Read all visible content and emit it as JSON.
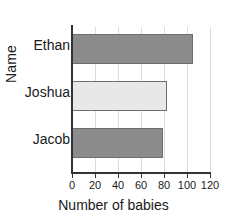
{
  "chart_data": {
    "type": "bar",
    "orientation": "horizontal",
    "title": "",
    "xlabel": "Number of babies",
    "ylabel": "Name",
    "categories": [
      "Ethan",
      "Joshua",
      "Jacob"
    ],
    "values": [
      105,
      83,
      79
    ],
    "series": [
      {
        "name": "Number of babies",
        "values": [
          105,
          83,
          79
        ]
      }
    ],
    "bar_colors": [
      "#8c8c8c",
      "#e8e8e8",
      "#8c8c8c"
    ],
    "bar_border_color": "#6e6e6e",
    "xlim": [
      0,
      120
    ],
    "xticks": [
      0,
      20,
      40,
      60,
      80,
      100,
      120
    ],
    "xtick_labels": [
      "0",
      "20",
      "40",
      "60",
      "80",
      "100",
      "120"
    ],
    "grid": "vertical",
    "legend": "none",
    "axis_color": "#333333",
    "gridline_color": "#dcdcdc",
    "background": "#ffffff"
  }
}
